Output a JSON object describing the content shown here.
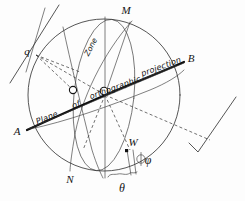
{
  "figure": {
    "kind": "orthographic-projection-sphere-diagram",
    "background_color": "#fdfdfd",
    "ink_color": "#141414",
    "emphasis_color": "#0d0d0d"
  },
  "labels": {
    "point_m": "M",
    "point_n": "N",
    "point_a": "A",
    "point_b": "B",
    "point_q": "q",
    "point_w": "W",
    "angle_phi": "φ",
    "angle_theta": "θ",
    "zone": "Zone",
    "plane_text_part1": "Plane",
    "plane_text_part2": "of",
    "plane_text_part3": "orthographic",
    "plane_text_part4": "projection",
    "plane_full": "Plane of orthographic projection"
  },
  "geometry": {
    "sphere_center_x": 104,
    "sphere_center_y": 95,
    "sphere_radius": 76,
    "node_o_center": [
      104,
      95
    ],
    "node_o_left": [
      73,
      90
    ],
    "point_w": [
      128,
      152
    ]
  }
}
